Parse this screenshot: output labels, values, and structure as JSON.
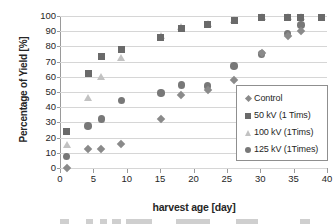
{
  "chart_data": {
    "type": "scatter",
    "title": "",
    "xlabel": "harvest age [day]",
    "ylabel": "Percentage of Yield  [%]",
    "xlim": [
      0,
      40
    ],
    "ylim": [
      0,
      100
    ],
    "xticks": [
      0,
      5,
      10,
      15,
      20,
      25,
      30,
      35,
      40
    ],
    "yticks": [
      0,
      10,
      20,
      30,
      40,
      50,
      60,
      70,
      80,
      90,
      100
    ],
    "grid": "horizontal",
    "legend_position": "right-middle",
    "series": [
      {
        "name": "Control",
        "marker": "diamond",
        "color": "#8a8a8a",
        "points": [
          {
            "x": 1,
            "y": 0
          },
          {
            "x": 4.2,
            "y": 12.8
          },
          {
            "x": 6.2,
            "y": 12.5
          },
          {
            "x": 9.2,
            "y": 15.7
          },
          {
            "x": 15.1,
            "y": 32.0
          },
          {
            "x": 18.2,
            "y": 48.0
          },
          {
            "x": 22.1,
            "y": 51.5
          },
          {
            "x": 26.1,
            "y": 58.0
          },
          {
            "x": 30.2,
            "y": 75.5
          },
          {
            "x": 34.1,
            "y": 87.0
          },
          {
            "x": 36.1,
            "y": 90.0
          }
        ]
      },
      {
        "name": "50 kV (1 Tims)",
        "marker": "square",
        "color": "#6a6a6a",
        "points": [
          {
            "x": 1,
            "y": 24.2
          },
          {
            "x": 4.2,
            "y": 62.0
          },
          {
            "x": 6.2,
            "y": 73.2
          },
          {
            "x": 9.2,
            "y": 77.8
          },
          {
            "x": 15.1,
            "y": 85.8
          },
          {
            "x": 18.2,
            "y": 92.0
          },
          {
            "x": 22.1,
            "y": 94.5
          },
          {
            "x": 26.1,
            "y": 96.8
          },
          {
            "x": 30.2,
            "y": 99.0
          },
          {
            "x": 34.1,
            "y": 99.0
          },
          {
            "x": 36.1,
            "y": 99.2
          },
          {
            "x": 39.2,
            "y": 99.0
          }
        ]
      },
      {
        "name": "100 kV (1Tims)",
        "marker": "triangle",
        "color": "#c2c2c2",
        "points": [
          {
            "x": 1,
            "y": 15.5
          },
          {
            "x": 4.2,
            "y": 46.5
          },
          {
            "x": 6.2,
            "y": 60.3
          },
          {
            "x": 9.2,
            "y": 73.0
          },
          {
            "x": 15.1,
            "y": 87.0
          },
          {
            "x": 18.2,
            "y": 93.0
          },
          {
            "x": 22.1,
            "y": 95.0
          },
          {
            "x": 26.1,
            "y": 98.0
          },
          {
            "x": 30.2,
            "y": 99.5
          },
          {
            "x": 34.1,
            "y": 99.5
          },
          {
            "x": 36.1,
            "y": 99.5
          }
        ]
      },
      {
        "name": "125 kV (1Times)",
        "marker": "circle",
        "color": "#787878",
        "points": [
          {
            "x": 1,
            "y": 7.5
          },
          {
            "x": 4.2,
            "y": 27.5
          },
          {
            "x": 6.2,
            "y": 32.3
          },
          {
            "x": 9.2,
            "y": 44.5
          },
          {
            "x": 15.1,
            "y": 49.3
          },
          {
            "x": 18.2,
            "y": 54.5
          },
          {
            "x": 22.1,
            "y": 54.0
          },
          {
            "x": 26.1,
            "y": 67.0
          },
          {
            "x": 30.2,
            "y": 75.0
          },
          {
            "x": 34.1,
            "y": 88.5
          },
          {
            "x": 36.1,
            "y": 94.0
          }
        ]
      }
    ]
  },
  "legend": {
    "items": [
      {
        "label": "Control",
        "marker": "diamond"
      },
      {
        "label": "50 kV (1 Tims)",
        "marker": "square"
      },
      {
        "label": "100 kV (1Tims)",
        "marker": "triangle"
      },
      {
        "label": "125 kV (1Times)",
        "marker": "circle"
      }
    ]
  }
}
